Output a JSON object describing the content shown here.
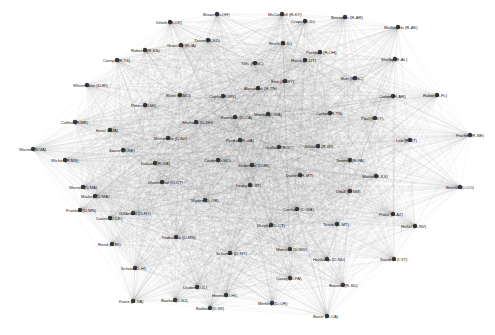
{
  "graph": {
    "type": "network",
    "background": "#ffffff",
    "edge_color": "#6a6a6a",
    "node_color": "#3a3a3a",
    "label_color": "#222222",
    "nodes": [
      {
        "label": "Brown (D-OH)",
        "x": 217,
        "y": 14
      },
      {
        "label": "McConnell (R-KY)",
        "x": 282,
        "y": 14
      },
      {
        "label": "Boozman (R-AR)",
        "x": 345,
        "y": 17
      },
      {
        "label": "Murkowski (R-AK)",
        "x": 398,
        "y": 27
      },
      {
        "label": "Inhofe (R-OK)",
        "x": 170,
        "y": 22
      },
      {
        "label": "Crapo (R-ID)",
        "x": 305,
        "y": 21
      },
      {
        "label": "Roberts (R-KS)",
        "x": 145,
        "y": 50
      },
      {
        "label": "Grassley (R-IA)",
        "x": 181,
        "y": 45
      },
      {
        "label": "Thune (R-SD)",
        "x": 208,
        "y": 40
      },
      {
        "label": "Cornyn (R-TX)",
        "x": 117,
        "y": 60
      },
      {
        "label": "Whitehouse (D-RI)",
        "x": 87,
        "y": 85
      },
      {
        "label": "Collins (R-ME)",
        "x": 75,
        "y": 122
      },
      {
        "label": "Warner (D-VA)",
        "x": 33,
        "y": 149
      },
      {
        "label": "Wicker (R-MS)",
        "x": 65,
        "y": 160
      },
      {
        "label": "Risch (R-ID)",
        "x": 283,
        "y": 43
      },
      {
        "label": "Portman (R-OH)",
        "x": 320,
        "y": 52
      },
      {
        "label": "Hatch (R-UT)",
        "x": 305,
        "y": 60
      },
      {
        "label": "Shelby (R-AL)",
        "x": 395,
        "y": 59
      },
      {
        "label": "Burr (R-NC)",
        "x": 355,
        "y": 78
      },
      {
        "label": "Enzi (R-WY)",
        "x": 285,
        "y": 81
      },
      {
        "label": "Cotton (R-AR)",
        "x": 393,
        "y": 96
      },
      {
        "label": "Rubio (R-FL)",
        "x": 437,
        "y": 95
      },
      {
        "label": "Fischer (R-NE)",
        "x": 470,
        "y": 135
      },
      {
        "label": "Lee (R-UT)",
        "x": 410,
        "y": 140
      },
      {
        "label": "Paul (R-KY)",
        "x": 375,
        "y": 118
      },
      {
        "label": "Corker (R-TN)",
        "x": 330,
        "y": 113
      },
      {
        "label": "Bennet (D-CO)",
        "x": 460,
        "y": 187
      },
      {
        "label": "Heller (R-NV)",
        "x": 415,
        "y": 226
      },
      {
        "label": "Flake (R-AZ)",
        "x": 393,
        "y": 214
      },
      {
        "label": "Sanders (I-VT)",
        "x": 394,
        "y": 259
      },
      {
        "label": "Cantwell (D-WA)",
        "x": 297,
        "y": 209
      },
      {
        "label": "Manchin (D-WV)",
        "x": 290,
        "y": 249
      },
      {
        "label": "Heitkamp (D-ND)",
        "x": 327,
        "y": 259
      },
      {
        "label": "Tester (D-MT)",
        "x": 337,
        "y": 224
      },
      {
        "label": "Udall (D-NM)",
        "x": 350,
        "y": 191
      },
      {
        "label": "Casey (D-PA)",
        "x": 290,
        "y": 278
      },
      {
        "label": "Rounds (R-SD)",
        "x": 343,
        "y": 285
      },
      {
        "label": "Merkley (D-OR)",
        "x": 272,
        "y": 303
      },
      {
        "label": "Boxer (D-CA)",
        "x": 327,
        "y": 316
      },
      {
        "label": "Baldwin (D-WI)",
        "x": 210,
        "y": 308
      },
      {
        "label": "Booker (D-NJ)",
        "x": 175,
        "y": 300
      },
      {
        "label": "Kaine (D-VA)",
        "x": 133,
        "y": 301
      },
      {
        "label": "Schatz (D-HI)",
        "x": 135,
        "y": 268
      },
      {
        "label": "Reed (D-RI)",
        "x": 112,
        "y": 244
      },
      {
        "label": "Coons (D-DE)",
        "x": 110,
        "y": 218
      },
      {
        "label": "Markey (D-MA)",
        "x": 95,
        "y": 196
      },
      {
        "label": "Warren (D-MA)",
        "x": 83,
        "y": 187
      },
      {
        "label": "Franken (D-MN)",
        "x": 80,
        "y": 210
      },
      {
        "label": "Gillibrand (D-NY)",
        "x": 133,
        "y": 213
      },
      {
        "label": "Klobuchar (D-MN)",
        "x": 176,
        "y": 237
      },
      {
        "label": "Schumer (D-NY)",
        "x": 230,
        "y": 253
      },
      {
        "label": "Murphy (D-CT)",
        "x": 271,
        "y": 225
      },
      {
        "label": "Hirono (D-HI)",
        "x": 226,
        "y": 295
      },
      {
        "label": "Durbin (D-IL)",
        "x": 197,
        "y": 287
      },
      {
        "label": "Blumenthal (D-CT)",
        "x": 162,
        "y": 182
      },
      {
        "label": "Wyden (D-OR)",
        "x": 205,
        "y": 200
      },
      {
        "label": "Leahy (D-VT)",
        "x": 250,
        "y": 185
      },
      {
        "label": "Stabenow (D-MI)",
        "x": 252,
        "y": 165
      },
      {
        "label": "Cardin (D-MD)",
        "x": 218,
        "y": 160
      },
      {
        "label": "Menendez (D-NJ)",
        "x": 168,
        "y": 138
      },
      {
        "label": "Shaheen (D-NH)",
        "x": 196,
        "y": 122
      },
      {
        "label": "Feinstein (D-CA)",
        "x": 235,
        "y": 117
      },
      {
        "label": "Murray (D-WA)",
        "x": 268,
        "y": 114
      },
      {
        "label": "Peters (D-MI)",
        "x": 145,
        "y": 105
      },
      {
        "label": "Blunt (R-MO)",
        "x": 180,
        "y": 95
      },
      {
        "label": "Capito (R-WV)",
        "x": 223,
        "y": 96
      },
      {
        "label": "Alexander (R-TN)",
        "x": 258,
        "y": 88
      },
      {
        "label": "Johnson (R-WI)",
        "x": 318,
        "y": 146
      },
      {
        "label": "Graham (R-SC)",
        "x": 279,
        "y": 147
      },
      {
        "label": "Perdue (R-GA)",
        "x": 240,
        "y": 140
      },
      {
        "label": "Isakson (R-GA)",
        "x": 155,
        "y": 163
      },
      {
        "label": "Toomey (R-PA)",
        "x": 350,
        "y": 160
      },
      {
        "label": "Moran (R-KS)",
        "x": 376,
        "y": 176
      },
      {
        "label": "Daines (R-MT)",
        "x": 300,
        "y": 175
      },
      {
        "label": "Sasse (R-NE)",
        "x": 123,
        "y": 150
      },
      {
        "label": "Ernst (R-IA)",
        "x": 110,
        "y": 130
      },
      {
        "label": "Tillis (R-NC)",
        "x": 255,
        "y": 63
      }
    ]
  }
}
